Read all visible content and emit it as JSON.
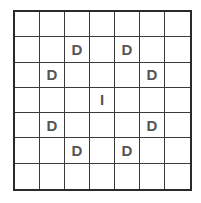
{
  "puzzle": {
    "rows": 7,
    "cols": 7,
    "colors": {
      "grid_line": "#3a3a3a",
      "border": "#2a2a2a",
      "letter": "#555555",
      "background": "#ffffff"
    },
    "cells": [
      [
        "",
        "",
        "",
        "",
        "",
        "",
        ""
      ],
      [
        "",
        "",
        "D",
        "",
        "D",
        "",
        ""
      ],
      [
        "",
        "D",
        "",
        "",
        "",
        "D",
        ""
      ],
      [
        "",
        "",
        "",
        "I",
        "",
        "",
        ""
      ],
      [
        "",
        "D",
        "",
        "",
        "",
        "D",
        ""
      ],
      [
        "",
        "",
        "D",
        "",
        "D",
        "",
        ""
      ],
      [
        "",
        "",
        "",
        "",
        "",
        "",
        ""
      ]
    ]
  }
}
